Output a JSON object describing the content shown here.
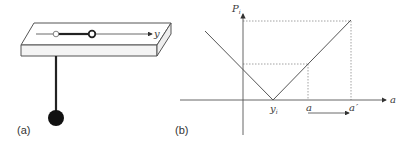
{
  "figure": {
    "panels": [
      {
        "id": "a",
        "label": "(a)",
        "description": "Pendulum hanging below a slab with a sliding pivot along the y axis",
        "axis_label": "y"
      },
      {
        "id": "b",
        "label": "(b)",
        "description": "V-shaped payoff curve P_i versus position a, with minimum at y_i",
        "y_axis_label": "P",
        "y_axis_subscript": "i",
        "x_axis_label": "a",
        "x_ticks": [
          {
            "label": "y",
            "subscript": "i"
          },
          {
            "label": "a",
            "subscript": ""
          },
          {
            "label": "a",
            "prime": "′"
          }
        ]
      }
    ]
  },
  "colors": {
    "line": "#555555",
    "dark": "#1a1a1a",
    "dotted": "#8a8a8a",
    "slab_face": "#f4f4f4"
  }
}
